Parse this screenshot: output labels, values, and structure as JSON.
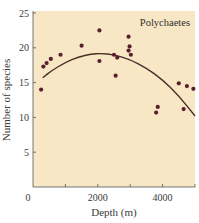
{
  "chart_data": {
    "type": "scatter",
    "title": "",
    "panel_label": "Polychaetes",
    "xlabel": "Depth (m)",
    "ylabel": "Number of species",
    "xlim": [
      0,
      5000
    ],
    "ylim": [
      0,
      25
    ],
    "x_ticks": [
      0,
      1000,
      2000,
      3000,
      4000,
      5000
    ],
    "x_tick_labels": [
      "0",
      "",
      "2000",
      "",
      "4000",
      ""
    ],
    "y_ticks": [
      0,
      5,
      10,
      15,
      20,
      25
    ],
    "y_tick_labels": [
      "",
      "5",
      "10",
      "15",
      "20",
      "25"
    ],
    "grid": false,
    "legend": "none",
    "colors": {
      "plot_background": "#F7E7C4",
      "points": "#5A1F2E",
      "curve": "#4A2E2A",
      "axis": "#555555"
    },
    "series": [
      {
        "name": "Observed species counts",
        "type": "scatter",
        "points": [
          {
            "x": 250,
            "y": 14.0
          },
          {
            "x": 320,
            "y": 17.3
          },
          {
            "x": 420,
            "y": 17.8
          },
          {
            "x": 550,
            "y": 18.4
          },
          {
            "x": 850,
            "y": 19.0
          },
          {
            "x": 1500,
            "y": 20.3
          },
          {
            "x": 2050,
            "y": 22.5
          },
          {
            "x": 2050,
            "y": 18.1
          },
          {
            "x": 2500,
            "y": 19.0
          },
          {
            "x": 2550,
            "y": 16.0
          },
          {
            "x": 2600,
            "y": 18.6
          },
          {
            "x": 2950,
            "y": 21.6
          },
          {
            "x": 2980,
            "y": 20.2
          },
          {
            "x": 2950,
            "y": 19.6
          },
          {
            "x": 3020,
            "y": 19.0
          },
          {
            "x": 3800,
            "y": 10.7
          },
          {
            "x": 3850,
            "y": 11.5
          },
          {
            "x": 4500,
            "y": 14.9
          },
          {
            "x": 4650,
            "y": 11.2
          },
          {
            "x": 4750,
            "y": 14.5
          },
          {
            "x": 4950,
            "y": 14.1
          }
        ]
      },
      {
        "name": "Fitted quadratic trend",
        "type": "line",
        "points": [
          {
            "x": 300,
            "y": 15.7
          },
          {
            "x": 600,
            "y": 16.8
          },
          {
            "x": 1000,
            "y": 17.9
          },
          {
            "x": 1400,
            "y": 18.7
          },
          {
            "x": 1800,
            "y": 19.1
          },
          {
            "x": 2100,
            "y": 19.2
          },
          {
            "x": 2500,
            "y": 19.0
          },
          {
            "x": 3000,
            "y": 18.3
          },
          {
            "x": 3500,
            "y": 17.1
          },
          {
            "x": 4000,
            "y": 15.4
          },
          {
            "x": 4500,
            "y": 13.1
          },
          {
            "x": 5000,
            "y": 10.2
          }
        ]
      }
    ]
  }
}
